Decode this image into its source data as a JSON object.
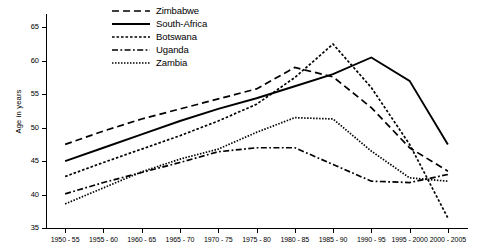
{
  "chart_data": {
    "type": "line",
    "title": "",
    "xlabel": "",
    "ylabel": "Age in years",
    "grid": false,
    "legend_position": "top-center",
    "categories": [
      "1950 - 55",
      "1955 - 60",
      "1960 - 65",
      "1965 - 70",
      "1970 - 75",
      "1975 - 80",
      "1980 - 85",
      "1985 - 90",
      "1990 - 95",
      "1995 - 2000",
      "2000 - 2005"
    ],
    "ylim": [
      35,
      67
    ],
    "yticks": [
      35,
      40,
      45,
      50,
      55,
      60,
      65
    ],
    "ytick_labels": [
      "35",
      "40",
      "45",
      "50",
      "55",
      "60",
      "65"
    ],
    "series": [
      {
        "name": "Zimbabwe",
        "style": "dashed",
        "values": [
          47.5,
          49.5,
          51.3,
          52.8,
          54.3,
          55.8,
          59.0,
          57.6,
          53.0,
          47.0,
          43.5
        ]
      },
      {
        "name": "South-Africa",
        "style": "solid",
        "values": [
          45.0,
          47.0,
          49.0,
          51.0,
          52.8,
          54.4,
          56.2,
          58.0,
          60.5,
          57.0,
          47.5
        ]
      },
      {
        "name": "Botswana",
        "style": "dotted",
        "values": [
          42.7,
          44.8,
          46.8,
          48.8,
          51.0,
          53.5,
          57.5,
          62.5,
          56.0,
          47.5,
          36.5
        ]
      },
      {
        "name": "Uganda",
        "style": "dash-dot",
        "values": [
          40.1,
          41.8,
          43.3,
          44.8,
          46.4,
          47.0,
          47.0,
          44.5,
          42.0,
          41.8,
          43.0
        ]
      },
      {
        "name": "Zambia",
        "style": "fine-dotted",
        "values": [
          38.6,
          41.0,
          43.4,
          45.3,
          46.8,
          49.3,
          51.5,
          51.3,
          46.5,
          42.5,
          42.0
        ]
      }
    ]
  },
  "legend": {
    "items": [
      {
        "label": "Zimbabwe"
      },
      {
        "label": "South-Africa"
      },
      {
        "label": "Botswana"
      },
      {
        "label": "Uganda"
      },
      {
        "label": "Zambia"
      }
    ]
  }
}
